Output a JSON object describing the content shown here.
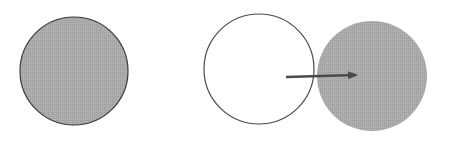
{
  "diagram": {
    "background": "#ffffff",
    "shapes": [
      {
        "id": "left-filled-circle",
        "cx": 74,
        "cy": 71,
        "r": 54,
        "fill": "#a9a9a9",
        "stroke": "#3a3a3a",
        "stroke_width": 1.2
      },
      {
        "id": "middle-hollow-circle",
        "cx": 259,
        "cy": 69,
        "r": 55,
        "fill": "#ffffff",
        "stroke": "#4a4a4a",
        "stroke_width": 1.2
      },
      {
        "id": "right-filled-circle",
        "cx": 372,
        "cy": 76,
        "r": 55,
        "fill": "#a5a5a5",
        "stroke": "none",
        "stroke_width": 0
      }
    ],
    "arrow": {
      "x1": 286,
      "y1": 77,
      "x2": 356,
      "y2": 75,
      "color": "#4a4a4a",
      "width": 2.5
    }
  }
}
